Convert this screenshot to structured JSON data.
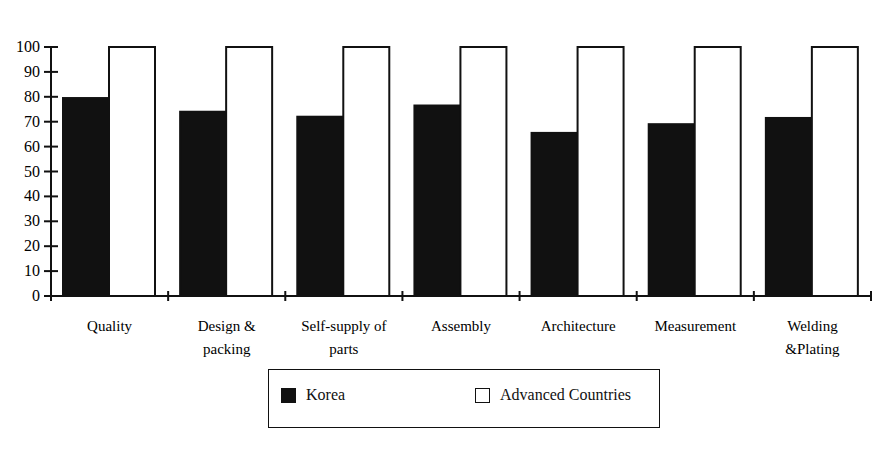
{
  "chart_data": {
    "type": "bar",
    "title": "",
    "xlabel": "",
    "ylabel": "",
    "ylim": [
      0,
      100
    ],
    "yticks": [
      0,
      10,
      20,
      30,
      40,
      50,
      60,
      70,
      80,
      90,
      100
    ],
    "grid": false,
    "legend_position": "bottom",
    "categories": [
      "Quality",
      "Design & packing",
      "Self-supply of parts",
      "Assembly",
      "Architecture",
      "Measurement",
      "Welding &Plating"
    ],
    "category_lines": [
      [
        "Quality"
      ],
      [
        "Design &",
        "packing"
      ],
      [
        "Self-supply of",
        "parts"
      ],
      [
        "Assembly"
      ],
      [
        "Architecture"
      ],
      [
        "Measurement"
      ],
      [
        "Welding",
        "&Plating"
      ]
    ],
    "series": [
      {
        "name": "Korea",
        "color": "#111111",
        "values": [
          79.5,
          74,
          72,
          76.5,
          65.5,
          69,
          71.5
        ]
      },
      {
        "name": "Advanced Countries",
        "color": "#ffffff",
        "values": [
          100,
          100,
          100,
          100,
          100,
          100,
          100
        ]
      }
    ]
  },
  "legend": {
    "items": [
      {
        "label": "Korea",
        "style": "filled"
      },
      {
        "label": "Advanced Countries",
        "style": "empty"
      }
    ]
  }
}
